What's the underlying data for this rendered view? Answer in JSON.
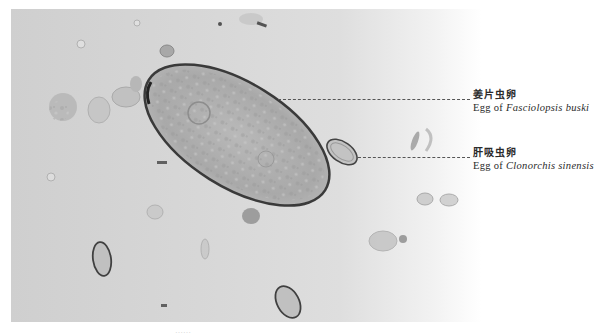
{
  "figure": {
    "type": "micrograph",
    "background_color": "#d4d4d4"
  },
  "labels": [
    {
      "zh": "姜片虫卵",
      "en_prefix": "Egg of",
      "en_species": "Fasciolopsis buski",
      "target": "large-egg"
    },
    {
      "zh": "肝吸虫卵",
      "en_prefix": "Egg of",
      "en_species": "Clonorchis sinensis",
      "target": "small-egg"
    }
  ],
  "caption": {
    "text": "……"
  }
}
